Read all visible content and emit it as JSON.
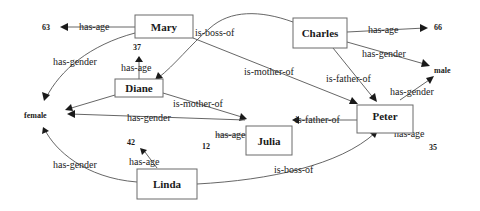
{
  "diagram": {
    "type": "knowledge-graph",
    "nodes": [
      {
        "id": "mary",
        "label": "Mary"
      },
      {
        "id": "charles",
        "label": "Charles"
      },
      {
        "id": "diane",
        "label": "Diane"
      },
      {
        "id": "julia",
        "label": "Julia"
      },
      {
        "id": "peter",
        "label": "Peter"
      },
      {
        "id": "linda",
        "label": "Linda"
      }
    ],
    "literals": [
      {
        "id": "age63",
        "label": "63"
      },
      {
        "id": "age66",
        "label": "66"
      },
      {
        "id": "age37",
        "label": "37"
      },
      {
        "id": "male",
        "label": "male"
      },
      {
        "id": "female",
        "label": "female"
      },
      {
        "id": "age42",
        "label": "42"
      },
      {
        "id": "age12",
        "label": "12"
      },
      {
        "id": "age35",
        "label": "35"
      }
    ],
    "edges": [
      {
        "from": "mary",
        "to": "age63",
        "label": "has-age"
      },
      {
        "from": "mary",
        "to": "female",
        "label": "has-gender"
      },
      {
        "from": "charles",
        "to": "diane",
        "label": "is-boss-of"
      },
      {
        "from": "mary",
        "to": "peter",
        "label": "is-mother-of"
      },
      {
        "from": "charles",
        "to": "age66",
        "label": "has-age"
      },
      {
        "from": "charles",
        "to": "male",
        "label": "has-gender"
      },
      {
        "from": "charles",
        "to": "peter",
        "label": "is-father-of"
      },
      {
        "from": "diane",
        "to": "age37",
        "label": "has-age"
      },
      {
        "from": "diane",
        "to": "julia",
        "label": "is-mother-of"
      },
      {
        "from": "julia",
        "to": "female",
        "label": "has-gender"
      },
      {
        "from": "diane",
        "to": "female",
        "label": "has-gender"
      },
      {
        "from": "peter",
        "to": "julia",
        "label": "is-father-of"
      },
      {
        "from": "peter",
        "to": "male",
        "label": "has-gender"
      },
      {
        "from": "julia",
        "to": "age12",
        "label": "has-age"
      },
      {
        "from": "peter",
        "to": "age35",
        "label": "has-age"
      },
      {
        "from": "linda",
        "to": "female",
        "label": "has-gender"
      },
      {
        "from": "linda",
        "to": "age42",
        "label": "has-age"
      },
      {
        "from": "linda",
        "to": "peter",
        "label": "is-boss-of"
      }
    ]
  }
}
